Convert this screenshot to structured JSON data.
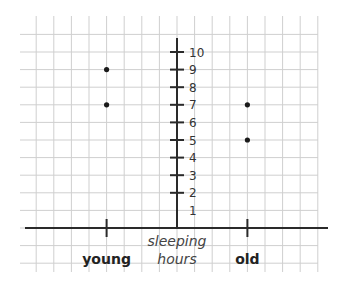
{
  "chart_data": {
    "type": "scatter",
    "title": "",
    "xlabel": "",
    "ylabel_lines": [
      "sleeping",
      "hours"
    ],
    "categories": [
      "young",
      "old"
    ],
    "yticks": [
      1,
      2,
      3,
      4,
      5,
      6,
      7,
      8,
      9,
      10
    ],
    "ylim": [
      0,
      10
    ],
    "grid": true,
    "series": [
      {
        "name": "young",
        "category": "young",
        "values": [
          9,
          7
        ]
      },
      {
        "name": "old",
        "category": "old",
        "values": [
          7,
          5
        ]
      }
    ]
  },
  "colors": {
    "grid": "#cfcfcf",
    "axis": "#2a2a2a",
    "point": "#1a1a1a"
  }
}
